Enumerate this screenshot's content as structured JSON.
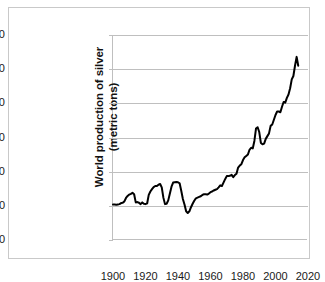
{
  "figure": {
    "background_color": "#ffffff",
    "frame_color": "#c9c9c9",
    "axis_color": "#bfbfbf",
    "grid_color": "#bfbfbf",
    "series_color": "#000000"
  },
  "chart_data": {
    "type": "line",
    "title": "",
    "xlabel": "",
    "ylabel": "World production of silver (metric tons)",
    "ylabel_line1": "World production of silver",
    "ylabel_line2": "(metric tons)",
    "xlim": [
      1900,
      2020
    ],
    "ylim": [
      0,
      30000
    ],
    "grid": true,
    "grid_axis": "y",
    "legend": false,
    "legend_position": "none",
    "y_ticks": [
      0,
      5000,
      10000,
      15000,
      20000,
      25000,
      30000
    ],
    "y_tick_labels": [
      "0",
      "5.000",
      "10.000",
      "15.000",
      "20.000",
      "25.000",
      "30.000"
    ],
    "x_ticks": [
      1900,
      1920,
      1940,
      1960,
      1980,
      2000,
      2020
    ],
    "x_tick_labels": [
      "1900",
      "1920",
      "1940",
      "1960",
      "1980",
      "2000",
      "2020"
    ],
    "series": [
      {
        "name": "World production of silver",
        "color": "#000000",
        "line_width": 2,
        "x": [
          1900,
          1901,
          1902,
          1903,
          1904,
          1905,
          1906,
          1907,
          1908,
          1909,
          1910,
          1911,
          1912,
          1913,
          1914,
          1915,
          1916,
          1917,
          1918,
          1919,
          1920,
          1921,
          1922,
          1923,
          1924,
          1925,
          1926,
          1927,
          1928,
          1929,
          1930,
          1931,
          1932,
          1933,
          1934,
          1935,
          1936,
          1937,
          1938,
          1939,
          1940,
          1941,
          1942,
          1943,
          1944,
          1945,
          1946,
          1947,
          1948,
          1949,
          1950,
          1951,
          1952,
          1953,
          1954,
          1955,
          1956,
          1957,
          1958,
          1959,
          1960,
          1961,
          1962,
          1963,
          1964,
          1965,
          1966,
          1967,
          1968,
          1969,
          1970,
          1971,
          1972,
          1973,
          1974,
          1975,
          1976,
          1977,
          1978,
          1979,
          1980,
          1981,
          1982,
          1983,
          1984,
          1985,
          1986,
          1987,
          1988,
          1989,
          1990,
          1991,
          1992,
          1993,
          1994,
          1995,
          1996,
          1997,
          1998,
          1999,
          2000,
          2001,
          2002,
          2003,
          2004,
          2005,
          2006,
          2007,
          2008,
          2009,
          2010,
          2011,
          2012,
          2013,
          2014
        ],
        "values": [
          5200,
          5200,
          5150,
          5200,
          5250,
          5400,
          5450,
          5650,
          6150,
          6450,
          6650,
          6750,
          6900,
          6700,
          5500,
          5550,
          5450,
          5250,
          5500,
          5300,
          5250,
          5350,
          6600,
          7100,
          7450,
          7750,
          7900,
          7900,
          8100,
          8200,
          7700,
          6200,
          5250,
          5300,
          5800,
          6800,
          7800,
          8400,
          8450,
          8500,
          8450,
          8300,
          7200,
          6000,
          5200,
          4200,
          3950,
          4200,
          4800,
          5300,
          5750,
          6100,
          6200,
          6300,
          6400,
          6600,
          6700,
          6700,
          6650,
          6800,
          7000,
          7100,
          7250,
          7350,
          7450,
          7700,
          8000,
          7900,
          8400,
          8900,
          9350,
          9350,
          9400,
          9550,
          9200,
          9500,
          9700,
          10600,
          10900,
          11100,
          11700,
          12100,
          12300,
          12500,
          13200,
          13500,
          13400,
          14500,
          16300,
          16500,
          15800,
          14200,
          14000,
          14100,
          14800,
          15200,
          15600,
          16700,
          16900,
          17600,
          18300,
          18800,
          18800,
          18700,
          19500,
          20200,
          20100,
          20800,
          21300,
          22200,
          23500,
          24000,
          25500,
          26800,
          25500
        ]
      }
    ]
  }
}
